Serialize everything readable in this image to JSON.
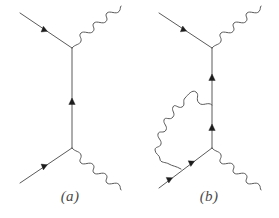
{
  "figure": {
    "type": "feynman-diagrams",
    "background_color": "#ffffff",
    "line_color": "#5a5a5a",
    "arrow_color": "#1d1d1d",
    "width": 279,
    "height": 218
  },
  "panels": [
    {
      "id": "a",
      "caption": "(a)",
      "description": "Tree-level Compton scattering diagram: incoming fermion from upper left, outgoing photon to upper right, vertical fermion propagator, incoming fermion from lower left, outgoing photon to lower right",
      "vertices": [
        {
          "name": "upper-vertex",
          "x": 72,
          "y": 48
        },
        {
          "name": "lower-vertex",
          "x": 72,
          "y": 148
        }
      ],
      "lines": [
        {
          "name": "incoming-fermion-upper",
          "kind": "fermion",
          "from": [
            20,
            13
          ],
          "to": [
            72,
            48
          ],
          "arrows": 1
        },
        {
          "name": "outgoing-photon-upper",
          "kind": "photon",
          "from": [
            72,
            48
          ],
          "to": [
            126,
            13
          ],
          "arrows": 0
        },
        {
          "name": "fermion-propagator",
          "kind": "fermion",
          "from": [
            72,
            148
          ],
          "to": [
            72,
            48
          ],
          "arrows": 1
        },
        {
          "name": "incoming-fermion-lower",
          "kind": "fermion",
          "from": [
            20,
            183
          ],
          "to": [
            72,
            148
          ],
          "arrows": 1
        },
        {
          "name": "outgoing-photon-lower",
          "kind": "photon",
          "from": [
            72,
            148
          ],
          "to": [
            126,
            183
          ],
          "arrows": 0
        }
      ]
    },
    {
      "id": "b",
      "caption": "(b)",
      "description": "One-loop vertex correction diagram: same topology as (a) with an internal photon loop connecting the fermion propagator to the incoming lower fermion line",
      "vertices": [
        {
          "name": "upper-vertex",
          "x": 212,
          "y": 48
        },
        {
          "name": "lower-vertex",
          "x": 212,
          "y": 148
        },
        {
          "name": "loop-vertex-propagator",
          "x": 212,
          "y": 105
        },
        {
          "name": "loop-vertex-fermion",
          "x": 181,
          "y": 169
        }
      ],
      "lines": [
        {
          "name": "incoming-fermion-upper",
          "kind": "fermion",
          "from": [
            159,
            13
          ],
          "to": [
            212,
            48
          ],
          "arrows": 1
        },
        {
          "name": "outgoing-photon-upper",
          "kind": "photon",
          "from": [
            212,
            48
          ],
          "to": [
            266,
            13
          ],
          "arrows": 0
        },
        {
          "name": "fermion-propagator",
          "kind": "fermion",
          "from": [
            212,
            148
          ],
          "to": [
            212,
            48
          ],
          "arrows": 2
        },
        {
          "name": "incoming-fermion-lower",
          "kind": "fermion",
          "from": [
            159,
            188
          ],
          "to": [
            212,
            148
          ],
          "arrows": 2
        },
        {
          "name": "outgoing-photon-lower",
          "kind": "photon",
          "from": [
            212,
            148
          ],
          "to": [
            266,
            183
          ],
          "arrows": 0
        },
        {
          "name": "photon-loop",
          "kind": "photon-loop",
          "from": [
            212,
            105
          ],
          "to": [
            181,
            169
          ],
          "arrows": 0
        }
      ]
    }
  ]
}
